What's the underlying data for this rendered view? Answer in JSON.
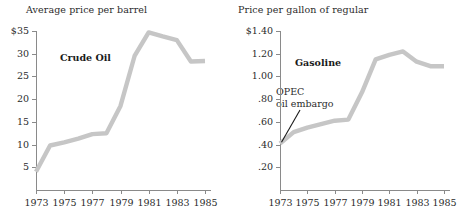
{
  "figure": {
    "background": "#ffffff",
    "line_color": "#c6c6c6",
    "axis_color": "#8a8a8a"
  },
  "charts": [
    {
      "id": "crude-oil",
      "title": "Average price per barrel",
      "series_label": "Crude Oil",
      "y_ticks": [
        "$35",
        "30",
        "25",
        "20",
        "15",
        "10",
        "5"
      ],
      "x_ticks": [
        "1973",
        "1975",
        "1977",
        "1979",
        "1981",
        "1983",
        "1985"
      ]
    },
    {
      "id": "gasoline",
      "title": "Price per gallon of regular",
      "series_label": "Gasoline",
      "annotation_line1": "OPEC",
      "annotation_line2": "oil embargo",
      "y_ticks": [
        "$1.40",
        "1.20",
        "1.00",
        ".80",
        ".60",
        ".40",
        ".20"
      ],
      "x_ticks": [
        "1973",
        "1975",
        "1977",
        "1979",
        "1981",
        "1983",
        "1985"
      ]
    }
  ],
  "chart_data": [
    {
      "type": "line",
      "title": "Average price per barrel",
      "subtitle": "Crude Oil",
      "xlabel": "",
      "ylabel": "Average price per barrel",
      "series_name": "Crude Oil",
      "x": [
        1973,
        1974,
        1975,
        1976,
        1977,
        1978,
        1979,
        1980,
        1981,
        1982,
        1983,
        1984,
        1985
      ],
      "values": [
        4.0,
        9.8,
        10.5,
        11.3,
        12.3,
        12.5,
        18.5,
        29.5,
        34.7,
        33.8,
        33.0,
        28.3,
        28.4
      ],
      "xlim": [
        1973,
        1985
      ],
      "ylim": [
        0,
        35
      ],
      "ytick_values": [
        35,
        30,
        25,
        20,
        15,
        10,
        5
      ],
      "ytick_labels": [
        "$35",
        "30",
        "25",
        "20",
        "15",
        "10",
        "5"
      ],
      "xtick_values": [
        1973,
        1975,
        1977,
        1979,
        1981,
        1983,
        1985
      ],
      "xtick_labels": [
        "1973",
        "1975",
        "1977",
        "1979",
        "1981",
        "1983",
        "1985"
      ],
      "grid": false,
      "legend": "none",
      "annotations": [
        {
          "text": "Crude Oil",
          "x": 1975.6,
          "y": 24.5
        }
      ]
    },
    {
      "type": "line",
      "title": "Price per gallon of regular",
      "subtitle": "Gasoline",
      "xlabel": "",
      "ylabel": "Price per gallon of regular",
      "series_name": "Gasoline",
      "x": [
        1973,
        1974,
        1975,
        1976,
        1977,
        1978,
        1979,
        1980,
        1981,
        1982,
        1983,
        1984,
        1985
      ],
      "values": [
        0.41,
        0.51,
        0.55,
        0.58,
        0.61,
        0.62,
        0.86,
        1.15,
        1.19,
        1.22,
        1.13,
        1.09,
        1.09
      ],
      "xlim": [
        1973,
        1985
      ],
      "ylim": [
        0,
        1.4
      ],
      "ytick_values": [
        1.4,
        1.2,
        1.0,
        0.8,
        0.6,
        0.4,
        0.2
      ],
      "ytick_labels": [
        "$1.40",
        "1.20",
        "1.00",
        ".80",
        ".60",
        ".40",
        ".20"
      ],
      "xtick_values": [
        1973,
        1975,
        1977,
        1979,
        1981,
        1983,
        1985
      ],
      "xtick_labels": [
        "1973",
        "1975",
        "1977",
        "1979",
        "1981",
        "1983",
        "1985"
      ],
      "grid": false,
      "legend": "none",
      "annotations": [
        {
          "text": "Gasoline",
          "x": 1975.0,
          "y": 1.08
        },
        {
          "text": "OPEC oil embargo",
          "x": 1974.2,
          "y": 0.82,
          "points_to": {
            "x": 1973.0,
            "y": 0.42
          }
        }
      ]
    }
  ]
}
